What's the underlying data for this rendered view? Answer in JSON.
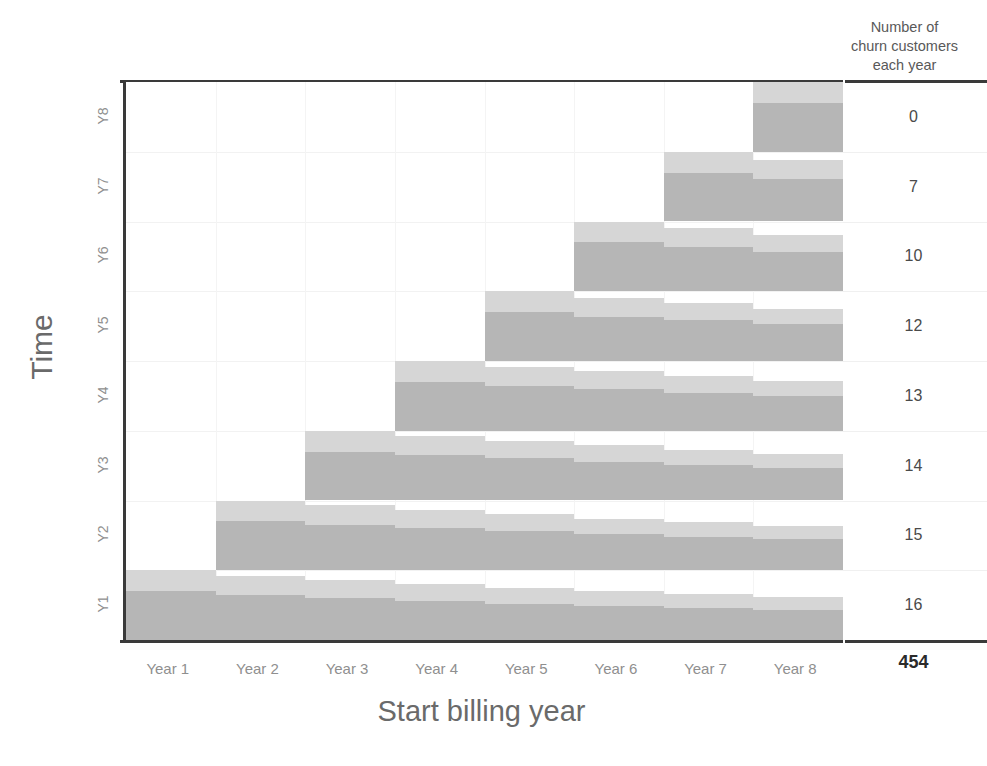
{
  "chart_data": {
    "type": "bar",
    "title": "",
    "xlabel": "Start billing year",
    "ylabel": "Time",
    "categories": [
      "Year 1",
      "Year 2",
      "Year 3",
      "Year 4",
      "Year 5",
      "Year 6",
      "Year 7",
      "Year 8"
    ],
    "row_labels": [
      "Y1",
      "Y2",
      "Y3",
      "Y4",
      "Y5",
      "Y6",
      "Y7",
      "Y8"
    ],
    "grid": true,
    "legend": "none",
    "orientation": "cohort-staircase",
    "series": [
      {
        "name": "Y1",
        "values": [
          1.0,
          0.92,
          0.86,
          0.8,
          0.74,
          0.7,
          0.66,
          0.62
        ]
      },
      {
        "name": "Y2",
        "values": [
          0.0,
          1.0,
          0.93,
          0.86,
          0.8,
          0.74,
          0.69,
          0.64
        ]
      },
      {
        "name": "Y3",
        "values": [
          0.0,
          0.0,
          1.0,
          0.93,
          0.86,
          0.79,
          0.73,
          0.67
        ]
      },
      {
        "name": "Y4",
        "values": [
          0.0,
          0.0,
          0.0,
          1.0,
          0.92,
          0.85,
          0.78,
          0.71
        ]
      },
      {
        "name": "Y5",
        "values": [
          0.0,
          0.0,
          0.0,
          0.0,
          1.0,
          0.91,
          0.83,
          0.75
        ]
      },
      {
        "name": "Y6",
        "values": [
          0.0,
          0.0,
          0.0,
          0.0,
          0.0,
          1.0,
          0.9,
          0.8
        ]
      },
      {
        "name": "Y7",
        "values": [
          0.0,
          0.0,
          0.0,
          0.0,
          0.0,
          0.0,
          1.0,
          0.88
        ]
      },
      {
        "name": "Y8",
        "values": [
          0.0,
          0.0,
          0.0,
          0.0,
          0.0,
          0.0,
          0.0,
          1.0
        ]
      }
    ],
    "split_ratio": 0.3,
    "colors": {
      "segment_top": "#d6d6d6",
      "segment_bottom": "#b6b6b6",
      "axis": "#3a3a3a",
      "grid": "#f2f2f2",
      "text": "#8f8f8f"
    }
  },
  "right_panel": {
    "header": "Number of\nchurn customers\neach year",
    "values": [
      "0",
      "7",
      "10",
      "12",
      "13",
      "14",
      "15",
      "16"
    ],
    "total": "454"
  }
}
